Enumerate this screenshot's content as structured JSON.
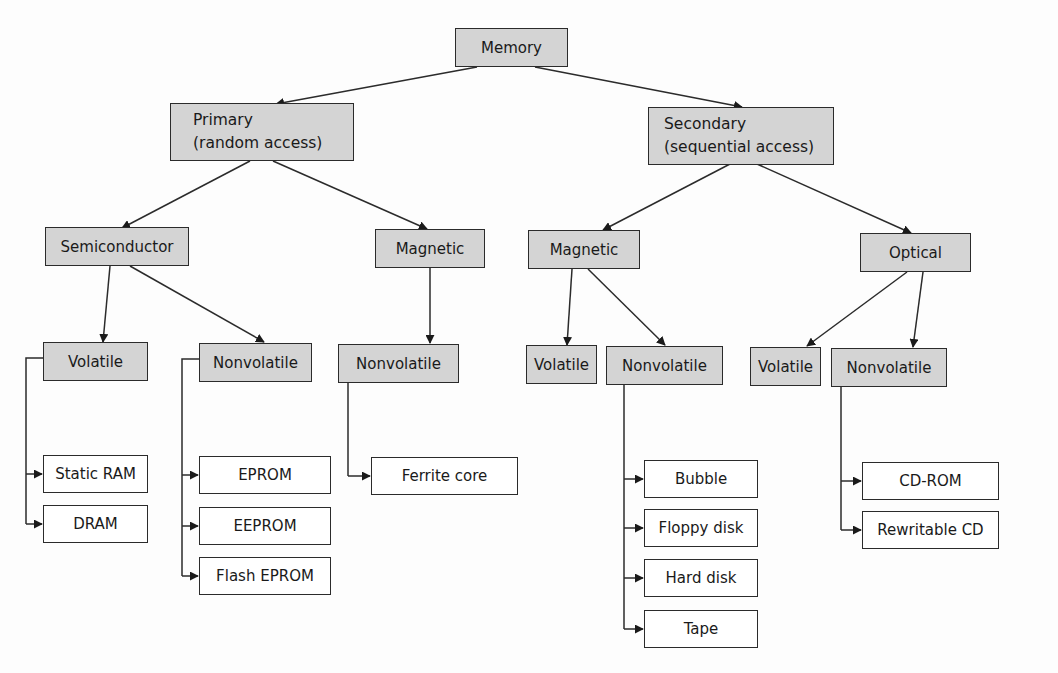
{
  "title": "Memory",
  "colors": {
    "category_fill": "#d4d4d4",
    "leaf_fill": "#ffffff",
    "stroke": "#2b2b2b"
  },
  "nodes": {
    "memory": {
      "label": "Memory"
    },
    "primary": {
      "line1": "Primary",
      "line2": "(random access)"
    },
    "secondary": {
      "line1": "Secondary",
      "line2": "(sequential access)"
    },
    "p_semiconductor": {
      "label": "Semiconductor"
    },
    "p_magnetic": {
      "label": "Magnetic"
    },
    "s_magnetic": {
      "label": "Magnetic"
    },
    "s_optical": {
      "label": "Optical"
    },
    "semi_volatile": {
      "label": "Volatile"
    },
    "semi_nonvolatile": {
      "label": "Nonvolatile"
    },
    "pmag_nonvolatile": {
      "label": "Nonvolatile"
    },
    "smag_volatile": {
      "label": "Volatile"
    },
    "smag_nonvolatile": {
      "label": "Nonvolatile"
    },
    "opt_volatile": {
      "label": "Volatile"
    },
    "opt_nonvolatile": {
      "label": "Nonvolatile"
    }
  },
  "leaves": {
    "semi_volatile": [
      "Static RAM",
      "DRAM"
    ],
    "semi_nonvolatile": [
      "EPROM",
      "EEPROM",
      "Flash EPROM"
    ],
    "pmag_nonvolatile": [
      "Ferrite core"
    ],
    "smag_nonvolatile": [
      "Bubble",
      "Floppy disk",
      "Hard disk",
      "Tape"
    ],
    "opt_nonvolatile": [
      "CD-ROM",
      "Rewritable CD"
    ]
  }
}
